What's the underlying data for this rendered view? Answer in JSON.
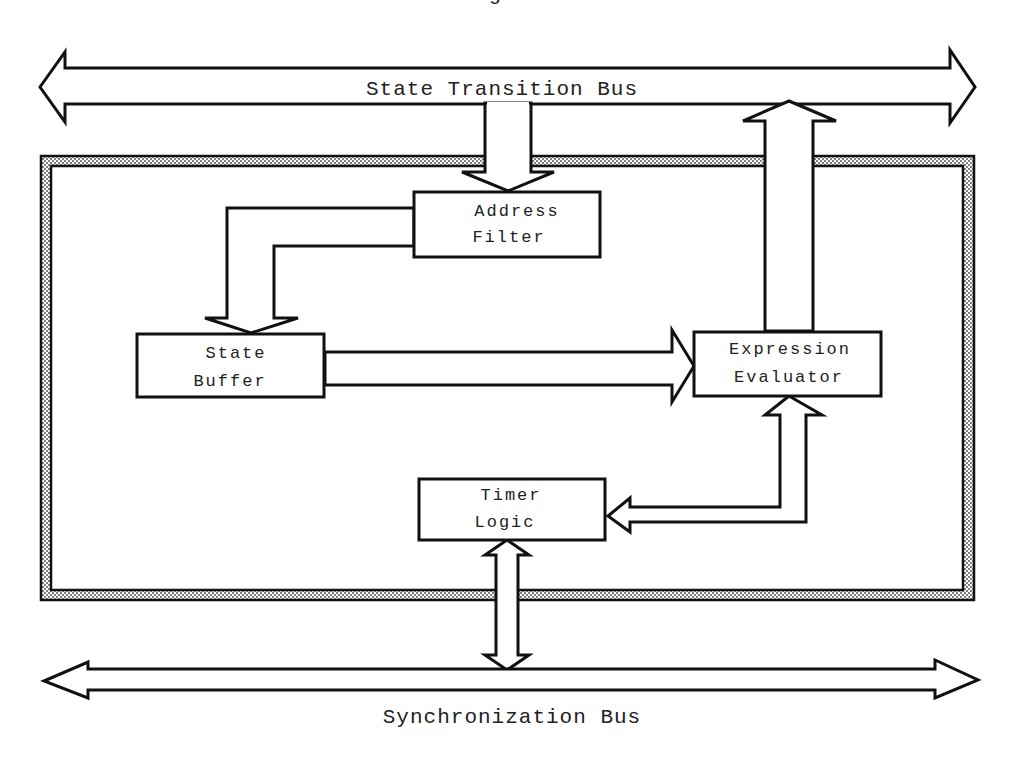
{
  "diagram": {
    "caption_partial": "Figure",
    "buses": {
      "top": {
        "label": "State Transition Bus"
      },
      "bottom": {
        "label": "Synchronization Bus"
      }
    },
    "blocks": {
      "address_filter": {
        "line1": "Address",
        "line2": "Filter"
      },
      "state_buffer": {
        "line1": "State",
        "line2": "Buffer"
      },
      "expression_evaluator": {
        "line1": "Expression",
        "line2": "Evaluator"
      },
      "timer_logic": {
        "line1": "Timer",
        "line2": "Logic"
      }
    },
    "connections": [
      {
        "from": "State Transition Bus",
        "to": "Address Filter",
        "type": "unidirectional"
      },
      {
        "from": "Address Filter",
        "to": "State Buffer",
        "type": "unidirectional"
      },
      {
        "from": "State Buffer",
        "to": "Expression Evaluator",
        "type": "unidirectional"
      },
      {
        "from": "Expression Evaluator",
        "to": "State Transition Bus",
        "type": "unidirectional"
      },
      {
        "from": "Timer Logic",
        "to": "Expression Evaluator",
        "type": "bidirectional"
      },
      {
        "from": "Timer Logic",
        "to": "Synchronization Bus",
        "type": "bidirectional"
      }
    ],
    "colors": {
      "stroke": "#111111",
      "frame_fill": "#b0b0b0",
      "background": "#ffffff"
    }
  }
}
